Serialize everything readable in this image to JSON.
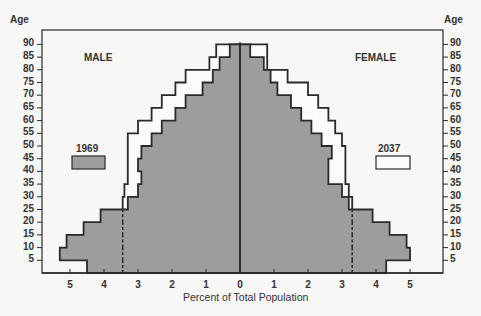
{
  "chart_data": {
    "type": "bar",
    "subtype": "population-pyramid",
    "title": "",
    "xlabel": "Percent of Total Population",
    "ylabel": "Age",
    "xlim": [
      -5.5,
      5.5
    ],
    "x_ticks": [
      5,
      4,
      3,
      2,
      1,
      0,
      1,
      2,
      3,
      4,
      5
    ],
    "y_ticks": [
      5,
      10,
      15,
      20,
      25,
      30,
      35,
      40,
      45,
      50,
      55,
      60,
      65,
      70,
      75,
      80,
      85,
      90
    ],
    "categories": [
      "0-4",
      "5-9",
      "10-14",
      "15-19",
      "20-24",
      "25-29",
      "30-34",
      "35-39",
      "40-44",
      "45-49",
      "50-54",
      "55-59",
      "60-64",
      "65-69",
      "70-74",
      "75-79",
      "80-84",
      "85-89"
    ],
    "left_label": "MALE",
    "right_label": "FEMALE",
    "legend": [
      {
        "label": "1969",
        "style": "filled gray",
        "position": "left"
      },
      {
        "label": "2037",
        "style": "outline",
        "position": "right"
      }
    ],
    "series": [
      {
        "name": "1969 Male",
        "values": [
          4.5,
          5.3,
          5.1,
          4.6,
          4.1,
          3.3,
          3.0,
          2.9,
          3.0,
          2.9,
          2.6,
          2.3,
          1.9,
          1.6,
          1.1,
          0.8,
          0.6,
          0.3
        ]
      },
      {
        "name": "1969 Female",
        "values": [
          4.3,
          5.0,
          4.9,
          4.4,
          3.9,
          3.2,
          3.0,
          2.6,
          2.6,
          2.7,
          2.4,
          2.1,
          1.8,
          1.5,
          1.1,
          0.9,
          0.7,
          0.3
        ]
      },
      {
        "name": "2037 Male",
        "values": [
          3.45,
          3.45,
          3.45,
          3.45,
          3.45,
          3.45,
          3.4,
          3.3,
          3.3,
          3.3,
          3.3,
          3.0,
          2.6,
          2.3,
          1.9,
          1.6,
          0.9,
          0.7
        ]
      },
      {
        "name": "2037 Female",
        "values": [
          3.3,
          3.3,
          3.3,
          3.3,
          3.3,
          3.3,
          3.2,
          3.1,
          3.1,
          3.1,
          3.0,
          2.8,
          2.6,
          2.3,
          2.0,
          1.4,
          0.8,
          0.8
        ]
      }
    ],
    "colors": {
      "fill": "#9d9d9b",
      "line": "#2a2a2a",
      "background": "#f7f7f5"
    }
  }
}
